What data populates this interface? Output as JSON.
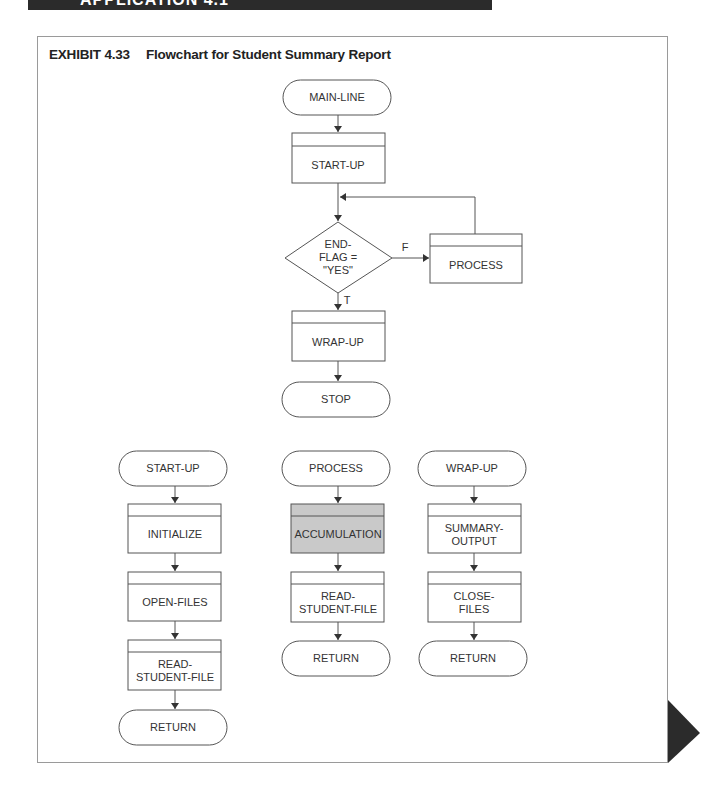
{
  "header": {
    "banner_text": "APPLICATION 4.1"
  },
  "exhibit": {
    "number": "EXHIBIT 4.33",
    "title": "Flowchart for Student Summary Report"
  },
  "main_flow": {
    "start": "MAIN-LINE",
    "startup": "START-UP",
    "decision_line1": "END-",
    "decision_line2": "FLAG =",
    "decision_line3": "\"YES\"",
    "false_label": "F",
    "true_label": "T",
    "process": "PROCESS",
    "wrapup": "WRAP-UP",
    "stop": "STOP"
  },
  "startup_module": {
    "entry": "START-UP",
    "step1": "INITIALIZE",
    "step2": "OPEN-FILES",
    "step3_line1": "READ-",
    "step3_line2": "STUDENT-FILE",
    "exit": "RETURN"
  },
  "process_module": {
    "entry": "PROCESS",
    "step1": "ACCUMULATION",
    "step2_line1": "READ-",
    "step2_line2": "STUDENT-FILE",
    "exit": "RETURN",
    "highlight_color": "#c9c9c9"
  },
  "wrapup_module": {
    "entry": "WRAP-UP",
    "step1_line1": "SUMMARY-",
    "step1_line2": "OUTPUT",
    "step2_line1": "CLOSE-",
    "step2_line2": "FILES",
    "exit": "RETURN"
  }
}
